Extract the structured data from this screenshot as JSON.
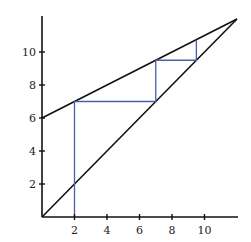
{
  "chart_data": {
    "type": "line",
    "title": "",
    "xlabel": "",
    "ylabel": "",
    "xlim": [
      0,
      12
    ],
    "ylim": [
      0,
      12
    ],
    "grid": false,
    "x_ticks": [
      2,
      4,
      6,
      8,
      10
    ],
    "y_ticks": [
      2,
      4,
      6,
      8,
      10
    ],
    "x_tick_labels": [
      "2",
      "4",
      "6",
      "8",
      "10"
    ],
    "y_tick_labels": [
      "2",
      "4",
      "6",
      "8",
      "10"
    ],
    "series": [
      {
        "name": "identity line y = x",
        "color": "#111111",
        "x": [
          0,
          12
        ],
        "y": [
          0,
          12
        ]
      },
      {
        "name": "line y = 0.5x + 6",
        "color": "#111111",
        "x": [
          0,
          12
        ],
        "y": [
          6,
          12
        ]
      },
      {
        "name": "cobweb iteration",
        "color": "#4a5fa8",
        "x": [
          2,
          2,
          7,
          7,
          9.5,
          9.5
        ],
        "y": [
          0,
          7,
          7,
          9.5,
          9.5,
          10.75
        ]
      }
    ]
  },
  "colors": {
    "axis": "#111111",
    "lines": "#111111",
    "cobweb": "#4a5fa8",
    "background": "#ffffff"
  }
}
